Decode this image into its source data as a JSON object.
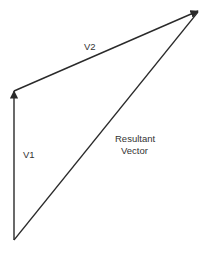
{
  "diagram": {
    "type": "vector-addition",
    "colors": {
      "line": "#2a2a2a",
      "text": "#333333",
      "background": "#ffffff"
    },
    "vectors": [
      {
        "id": "v1",
        "label": "V1",
        "from": [
          14,
          240
        ],
        "to": [
          14,
          90
        ]
      },
      {
        "id": "v2",
        "label": "V2",
        "from": [
          14,
          90
        ],
        "to": [
          199,
          11
        ]
      },
      {
        "id": "resultant",
        "label_line1": "Resultant",
        "label_line2": "Vector",
        "from": [
          14,
          240
        ],
        "to": [
          199,
          11
        ]
      }
    ],
    "labels": {
      "v1": "V1",
      "v2": "V2",
      "resultant_line1": "Resultant",
      "resultant_line2": "Vector"
    }
  }
}
